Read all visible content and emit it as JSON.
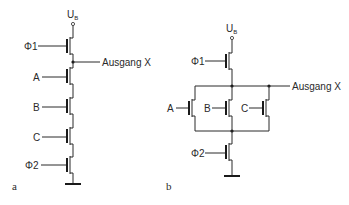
{
  "figure": {
    "panel_a": {
      "label": "a",
      "supply": {
        "main": "U",
        "sub": "B"
      },
      "output": "Ausgang X",
      "transistors": [
        {
          "gate": "Φ1"
        },
        {
          "gate": "A"
        },
        {
          "gate": "B"
        },
        {
          "gate": "C"
        },
        {
          "gate": "Φ2"
        }
      ]
    },
    "panel_b": {
      "label": "b",
      "supply": {
        "main": "U",
        "sub": "B"
      },
      "output": "Ausgang X",
      "transistors": [
        {
          "gate": "Φ1"
        },
        {
          "gate": "A"
        },
        {
          "gate": "B"
        },
        {
          "gate": "C"
        },
        {
          "gate": "Φ2"
        }
      ]
    }
  },
  "colors": {
    "line": "#2a2a2a",
    "background": "#ffffff"
  }
}
